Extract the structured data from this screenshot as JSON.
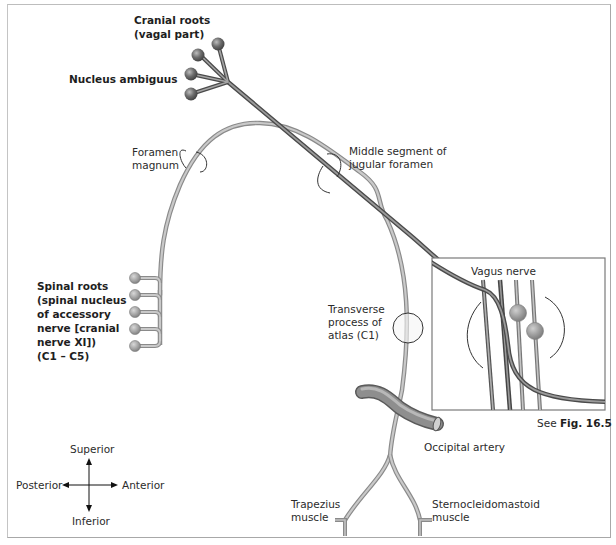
{
  "labels": {
    "cranial_roots": [
      "Cranial roots",
      "(vagal part)"
    ],
    "nucleus_ambiguus": "Nucleus ambiguus",
    "foramen_magnum": [
      "Foramen",
      "magnum"
    ],
    "jugular_foramen": [
      "Middle segment of",
      "jugular foramen"
    ],
    "spinal_roots": [
      "Spinal roots",
      "(spinal nucleus",
      "of accessory",
      "nerve [cranial",
      "nerve XI])",
      "(C1 – C5)"
    ],
    "transverse_process": [
      "Transverse",
      "process of",
      "atlas (C1)"
    ],
    "vagus_nerve": "Vagus nerve",
    "see_fig_prefix": "See",
    "see_fig_ref": "Fig. 16.5",
    "occipital_artery": "Occipital artery",
    "trapezius": [
      "Trapezius",
      "muscle"
    ],
    "sternocleidomastoid": [
      "Sternocleidomastoid",
      "muscle"
    ]
  },
  "orientation": {
    "superior": "Superior",
    "inferior": "Inferior",
    "posterior": "Posterior",
    "anterior": "Anterior"
  },
  "colors": {
    "cranial_nerve": "#6e6e6e",
    "spinal_nerve": "#a9a9a9",
    "nucleus": "#707070",
    "spinal_root_ball": "#9a9a9a",
    "artery": "#7a7a7a",
    "text": "#2b2b2b"
  }
}
